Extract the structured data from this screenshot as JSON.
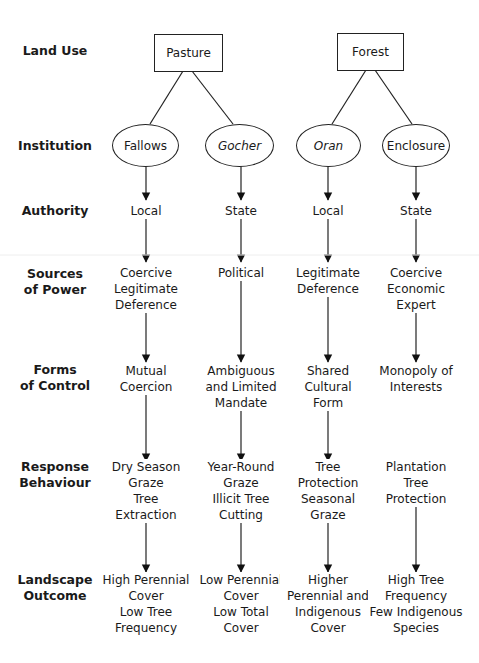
{
  "row_labels": {
    "land_use": "Land Use",
    "institution": "Institution",
    "authority": "Authority",
    "sources_of_power": [
      "Sources",
      "of Power"
    ],
    "forms_of_control": [
      "Forms",
      "of Control"
    ],
    "response_behaviour": [
      "Response",
      "Behaviour"
    ],
    "landscape_outcome": [
      "Landscape",
      "Outcome"
    ]
  },
  "land_use": [
    {
      "label": "Pasture"
    },
    {
      "label": "Forest"
    }
  ],
  "columns": [
    {
      "institution": "Fallows",
      "institution_italic": false,
      "authority": "Local",
      "sources_of_power": [
        "Coercive",
        "Legitimate",
        "Deference"
      ],
      "forms_of_control": [
        "Mutual",
        "Coercion"
      ],
      "response_behaviour": [
        "Dry Season",
        "Graze",
        "Tree",
        "Extraction"
      ],
      "landscape_outcome": [
        "High Perennial",
        "Cover",
        "Low Tree",
        "Frequency"
      ]
    },
    {
      "institution": "Gocher",
      "institution_italic": true,
      "authority": "State",
      "sources_of_power": [
        "Political"
      ],
      "forms_of_control": [
        "Ambiguous",
        "and Limited",
        "Mandate"
      ],
      "response_behaviour": [
        "Year-Round",
        "Graze",
        "Illicit Tree",
        "Cutting"
      ],
      "landscape_outcome": [
        "Low Perennial",
        "Cover",
        "Low Total",
        "Cover"
      ]
    },
    {
      "institution": "Oran",
      "institution_italic": true,
      "authority": "Local",
      "sources_of_power": [
        "Legitimate",
        "Deference"
      ],
      "forms_of_control": [
        "Shared",
        "Cultural",
        "Form"
      ],
      "response_behaviour": [
        "Tree",
        "Protection",
        "Seasonal",
        "Graze"
      ],
      "landscape_outcome": [
        "Higher",
        "Perennial and",
        "Indigenous",
        "Cover"
      ]
    },
    {
      "institution": "Enclosure",
      "institution_italic": false,
      "authority": "State",
      "sources_of_power": [
        "Coercive",
        "Economic",
        "Expert"
      ],
      "forms_of_control": [
        "Monopoly of",
        "Interests"
      ],
      "response_behaviour": [
        "Plantation",
        "Tree",
        "Protection"
      ],
      "landscape_outcome": [
        "High Tree",
        "Frequency",
        "Few Indigenous",
        "Species"
      ]
    }
  ]
}
